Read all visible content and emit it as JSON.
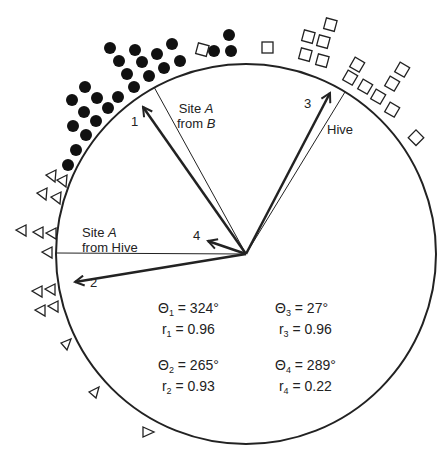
{
  "labels": {
    "site_a_from_b_1": "Site ",
    "site_a_from_b_A": "A",
    "site_a_from_b_2": "from ",
    "site_a_from_b_B": "B",
    "hive": "Hive",
    "site_a_from_hive_1": "Site ",
    "site_a_from_hive_A": "A",
    "site_a_from_hive_2": "from Hive",
    "arrow1": "1",
    "arrow2": "2",
    "arrow3": "3",
    "arrow4": "4"
  },
  "stats": [
    {
      "theta_sym": "Θ",
      "idx": "1",
      "theta": "= 324°",
      "r_sym": "r",
      "r": "= 0.96"
    },
    {
      "theta_sym": "Θ",
      "idx": "2",
      "theta": "= 265°",
      "r_sym": "r",
      "r": "= 0.93"
    },
    {
      "theta_sym": "Θ",
      "idx": "3",
      "theta": "= 27°",
      "r_sym": "r",
      "r": "= 0.96"
    },
    {
      "theta_sym": "Θ",
      "idx": "4",
      "theta": "= 289°",
      "r_sym": "r",
      "r": "= 0.22"
    }
  ],
  "legend_markers": {
    "group1": "filled-circle",
    "group2": "triangle",
    "group3": "square"
  }
}
